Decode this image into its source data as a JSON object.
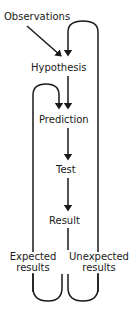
{
  "diagram": {
    "stroke_color": "#1a1a1a",
    "background_color": "#ffffff",
    "nodes": {
      "observations": "Observations",
      "hypothesis": "Hypothesis",
      "prediction": "Prediction",
      "test": "Test",
      "result": "Result",
      "expected_line1": "Expected",
      "expected_line2": "results",
      "unexpected_line1": "Unexpected",
      "unexpected_line2": "results"
    },
    "edges": [
      {
        "from": "observations",
        "to": "hypothesis",
        "style": "diagonal-arrow"
      },
      {
        "from": "hypothesis",
        "to": "prediction",
        "style": "straight-arrow"
      },
      {
        "from": "prediction",
        "to": "test",
        "style": "straight-arrow"
      },
      {
        "from": "test",
        "to": "result",
        "style": "straight-arrow"
      },
      {
        "from": "result",
        "to": "expected_results",
        "style": "split-line"
      },
      {
        "from": "result",
        "to": "unexpected_results",
        "style": "split-line"
      },
      {
        "from": "expected_results",
        "to": "prediction",
        "style": "left-feedback-loop"
      },
      {
        "from": "unexpected_results",
        "to": "hypothesis",
        "style": "right-feedback-loop"
      }
    ]
  }
}
